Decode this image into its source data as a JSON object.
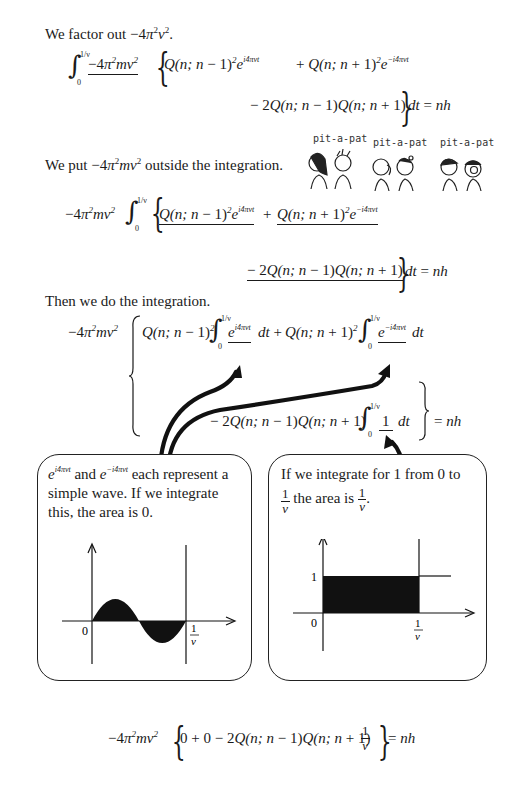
{
  "page": {
    "background": "#ffffff",
    "ink_color": "#1a1a1a"
  },
  "step1": {
    "intro": "We factor out −4π²ν².",
    "integral_upper": "1/ν",
    "integral_lower": "0",
    "factor": "−4π²mν²",
    "term1": "Q(n; n − 1)²e^{i4πνt}",
    "term2": "Q(n; n + 1)²e^{−i4πνt}",
    "term3": "− 2Q(n; n − 1)Q(n; n + 1)",
    "tail": "dt = nh"
  },
  "step2": {
    "intro": "We put −4π²mν² outside the integration.",
    "factor": "−4π²mν²",
    "term1": "Q(n; n − 1)²e^{i4πνt}",
    "term2": "Q(n; n + 1)²e^{−i4πνt}",
    "term3": "− 2Q(n; n − 1)Q(n; n + 1)",
    "tail": "dt = nh"
  },
  "cartoon": {
    "labels": [
      "pit-a-pat",
      "pit-a-pat",
      "pit-a-pat"
    ]
  },
  "step3": {
    "intro": "Then we do the integration.",
    "factor": "−4π²mν²",
    "coef1": "Q(n; n − 1)²",
    "integrand1": "e^{i4πνt}",
    "coef2": "Q(n; n + 1)²",
    "integrand2": "e^{−i4πνt}",
    "coef3": "− 2Q(n; n − 1)Q(n; n + 1)",
    "integrand3": "1",
    "dt": "dt",
    "plus": "+",
    "result": "= nh"
  },
  "box_left": {
    "text_line1_suffix": "each represent a",
    "text_line1_and": "and",
    "text_line2": "simple wave.  If we integrate",
    "text_line3": "this, the area is 0.",
    "axis_origin": "0",
    "axis_end_num": "1",
    "axis_end_den": "ν"
  },
  "box_right": {
    "text_line1": "If we integrate for 1 from 0 to",
    "text_line2_mid": "the area is",
    "frac_num": "1",
    "frac_den": "ν",
    "axis_origin": "0",
    "axis_y_tick": "1",
    "axis_end_num": "1",
    "axis_end_den": "ν"
  },
  "final": {
    "factor": "−4π²mν²",
    "body": "0 + 0 − 2Q(n; n − 1)Q(n; n + 1)",
    "frac_num": "1",
    "frac_den": "ν",
    "result": "= nh"
  }
}
